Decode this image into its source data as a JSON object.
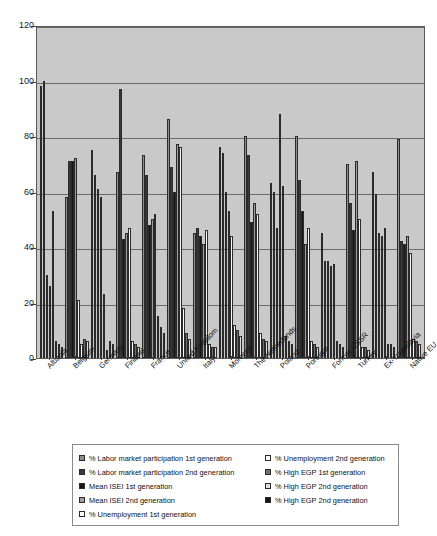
{
  "chart_data": {
    "type": "bar",
    "title": "",
    "xlabel": "",
    "ylabel": "",
    "ylim": [
      0,
      120
    ],
    "yticks": [
      0,
      20,
      40,
      60,
      80,
      100,
      120
    ],
    "grid": true,
    "legend_position": "bottom",
    "categories": [
      "Albania",
      "Belgium",
      "Germany",
      "Finland",
      "France",
      "United Kingdom",
      "Italy",
      "Morocco",
      "The Netherlands",
      "Poland",
      "Portugal",
      "Former USSR",
      "Turkey",
      "Ex-Yugoslavia",
      "Native EU"
    ],
    "series": [
      {
        "name": "% Labor market participation 1st generation",
        "color": "#8f8f8f",
        "values": [
          98,
          58,
          75,
          67,
          73,
          86,
          45,
          76,
          80,
          63,
          80,
          45,
          70,
          67,
          79
        ]
      },
      {
        "name": "% Labor market participation 2nd generation",
        "color": "#3a3a3a",
        "values": [
          100,
          71,
          66,
          97,
          66,
          69,
          47,
          74,
          73,
          60,
          64,
          35,
          56,
          59,
          42
        ]
      },
      {
        "name": "Mean ISEI 1st generation",
        "color": "#151515",
        "values": [
          30,
          71,
          61,
          43,
          48,
          60,
          44,
          60,
          49,
          47,
          53,
          35,
          46,
          45,
          41
        ]
      },
      {
        "name": "Mean ISEI 2nd generation",
        "color": "#9d9d9d",
        "values": [
          26,
          72,
          58,
          45,
          50,
          77,
          41,
          53,
          56,
          88,
          41,
          33,
          71,
          44,
          44
        ]
      },
      {
        "name": "% Unemployment 1st generation",
        "color": "#f7f7f7",
        "values": [
          53,
          21,
          23,
          47,
          52,
          76,
          46,
          44,
          52,
          62,
          47,
          34,
          50,
          47,
          38
        ]
      },
      {
        "name": "% Unemployment 2nd generation",
        "color": "#ffffff",
        "values": [
          6,
          5,
          3,
          6,
          15,
          18,
          5,
          12,
          9,
          8,
          6,
          6,
          4,
          5,
          7
        ]
      },
      {
        "name": "% High EGP 1st generation",
        "color": "#6e6e6e",
        "values": [
          5,
          7,
          6,
          5,
          11,
          9,
          4,
          10,
          7,
          6,
          5,
          5,
          4,
          5,
          6
        ]
      },
      {
        "name": "% High EGP 2nd generation",
        "color": "#dedede",
        "values": [
          4,
          6,
          5,
          4,
          9,
          7,
          4,
          8,
          6,
          5,
          4,
          4,
          3,
          4,
          5
        ]
      }
    ],
    "legend_entries": [
      {
        "label": "% Labor market participation 1st generation",
        "swatch": "#8f8f8f"
      },
      {
        "label": "% Labor market participation 2nd generation",
        "swatch": "#3a3a3a"
      },
      {
        "label": "Mean ISEI 1st generation",
        "swatch": "#151515"
      },
      {
        "label": "Mean ISEI 2nd generation",
        "swatch": "#9d9d9d"
      },
      {
        "label": "% Unemployment 1st generation",
        "swatch": "#ffffff"
      },
      {
        "label": "% Unemployment 2nd generation",
        "swatch": "#ffffff"
      },
      {
        "label": "% High EGP 1st generation",
        "swatch": "#6e6e6e"
      },
      {
        "label": "% High EGP 2nd generation",
        "swatch": "#dedede"
      },
      {
        "label": "% High EGP 2nd generation",
        "swatch": "#151515"
      }
    ]
  }
}
